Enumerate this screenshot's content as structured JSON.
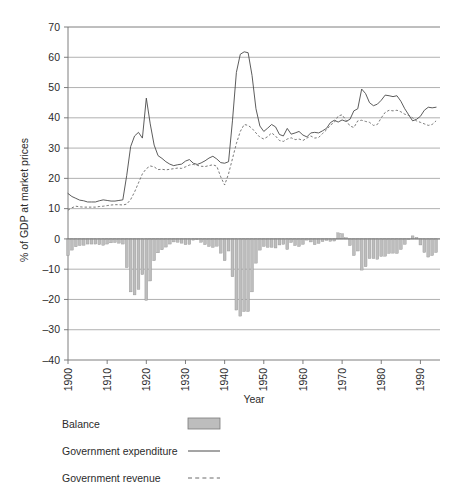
{
  "chart_data": {
    "type": "bar",
    "title": "",
    "subtitle": "",
    "xlabel": "Year",
    "ylabel": "% of GDP at market prices",
    "xlim": [
      1900,
      1995
    ],
    "ylim": [
      -40,
      70
    ],
    "ytick_values": [
      70,
      60,
      50,
      40,
      30,
      20,
      10,
      0,
      -10,
      -20,
      -30,
      -40
    ],
    "ytick_labels": [
      "70",
      "60",
      "50",
      "40",
      "30",
      "20",
      "10",
      "0",
      "–10",
      "–20",
      "–30",
      "–40"
    ],
    "xtick_values": [
      1900,
      1910,
      1920,
      1930,
      1940,
      1950,
      1960,
      1970,
      1980,
      1990
    ],
    "xtick_labels": [
      "1900",
      "1910",
      "1920",
      "1930",
      "1940",
      "1950",
      "1960",
      "1970",
      "1980",
      "1990"
    ],
    "grid": true,
    "grid_axis": "y",
    "legend_position": "below-plot-left",
    "x": [
      1900,
      1901,
      1902,
      1903,
      1904,
      1905,
      1906,
      1907,
      1908,
      1909,
      1910,
      1911,
      1912,
      1913,
      1914,
      1915,
      1916,
      1917,
      1918,
      1919,
      1920,
      1921,
      1922,
      1923,
      1924,
      1925,
      1926,
      1927,
      1928,
      1929,
      1930,
      1931,
      1932,
      1933,
      1934,
      1935,
      1936,
      1937,
      1938,
      1939,
      1940,
      1941,
      1942,
      1943,
      1944,
      1945,
      1946,
      1947,
      1948,
      1949,
      1950,
      1951,
      1952,
      1953,
      1954,
      1955,
      1956,
      1957,
      1958,
      1959,
      1960,
      1961,
      1962,
      1963,
      1964,
      1965,
      1966,
      1967,
      1968,
      1969,
      1970,
      1971,
      1972,
      1973,
      1974,
      1975,
      1976,
      1977,
      1978,
      1979,
      1980,
      1981,
      1982,
      1983,
      1984,
      1985,
      1986,
      1987,
      1988,
      1989,
      1990,
      1991,
      1992,
      1993,
      1994
    ],
    "series": [
      {
        "name": "Government expenditure",
        "style": "solid-line",
        "color": "#4a4a4a",
        "values": [
          15.0,
          14.0,
          13.4,
          12.8,
          12.6,
          12.2,
          12.2,
          12.2,
          12.6,
          12.9,
          12.7,
          12.5,
          12.5,
          12.7,
          12.9,
          21.0,
          30.5,
          34.0,
          35.2,
          33.3,
          46.5,
          38.0,
          31.0,
          27.5,
          26.6,
          25.5,
          24.7,
          24.2,
          24.5,
          24.7,
          25.7,
          26.2,
          25.0,
          24.6,
          25.1,
          25.8,
          26.7,
          27.3,
          26.4,
          25.2,
          25.0,
          25.5,
          39.0,
          55.0,
          61.0,
          61.8,
          61.5,
          54.0,
          43.0,
          37.3,
          35.5,
          36.6,
          37.8,
          37.0,
          34.5,
          34.0,
          36.5,
          34.6,
          35.0,
          35.5,
          34.3,
          33.7,
          35.0,
          35.2,
          35.0,
          35.7,
          36.5,
          38.4,
          39.2,
          38.6,
          39.3,
          38.8,
          39.5,
          42.3,
          43.0,
          49.5,
          48.0,
          45.0,
          44.0,
          44.5,
          45.8,
          47.5,
          47.3,
          47.0,
          47.3,
          45.5,
          43.0,
          41.0,
          39.0,
          39.5,
          40.5,
          42.5,
          43.5,
          43.3,
          43.5
        ]
      },
      {
        "name": "Government revenue",
        "style": "dashed-line",
        "color": "#6a6a6a",
        "values": [
          9.5,
          10.3,
          10.8,
          10.6,
          10.5,
          10.5,
          10.5,
          10.5,
          10.7,
          10.8,
          11.0,
          11.2,
          11.3,
          11.3,
          11.2,
          11.5,
          13.0,
          15.5,
          18.5,
          21.5,
          23.2,
          24.1,
          23.8,
          22.9,
          23.0,
          22.8,
          23.0,
          23.2,
          23.4,
          23.3,
          23.8,
          24.4,
          24.6,
          24.3,
          24.0,
          23.9,
          24.2,
          24.5,
          24.0,
          20.5,
          17.8,
          21.5,
          26.5,
          31.5,
          35.5,
          37.8,
          37.5,
          36.5,
          35.0,
          33.6,
          33.0,
          33.8,
          35.0,
          34.0,
          32.5,
          32.2,
          33.0,
          33.4,
          32.8,
          33.0,
          32.5,
          33.3,
          34.0,
          33.3,
          33.5,
          34.8,
          36.0,
          37.6,
          38.5,
          40.6,
          41.0,
          39.2,
          37.3,
          36.8,
          39.0,
          39.2,
          38.8,
          38.5,
          37.5,
          37.8,
          40.0,
          41.8,
          42.5,
          42.3,
          42.5,
          42.0,
          41.2,
          40.8,
          40.0,
          39.0,
          38.5,
          38.0,
          37.5,
          37.8,
          39.0
        ]
      }
    ],
    "bar_series": {
      "name": "Balance",
      "color": "#bdbdbd",
      "values": [
        -5.5,
        -3.7,
        -2.6,
        -2.2,
        -2.1,
        -1.7,
        -1.7,
        -1.7,
        -1.9,
        -2.1,
        -1.7,
        -1.3,
        -1.2,
        -1.4,
        -1.7,
        -9.5,
        -17.5,
        -18.5,
        -16.7,
        -11.8,
        -20.3,
        -13.9,
        -7.2,
        -4.6,
        -3.6,
        -2.7,
        -1.7,
        -1.0,
        -1.1,
        -1.4,
        -1.9,
        -1.8,
        -0.4,
        -0.3,
        -1.1,
        -1.9,
        -2.5,
        -2.8,
        -2.4,
        -4.7,
        -7.2,
        -4.0,
        -12.5,
        -23.5,
        -25.5,
        -24.0,
        -24.0,
        -17.5,
        -8.0,
        -3.7,
        -2.5,
        -2.8,
        -2.8,
        -3.0,
        -2.0,
        -1.8,
        -3.5,
        -1.2,
        -2.2,
        -2.5,
        -1.8,
        -0.4,
        -1.0,
        -1.9,
        -1.5,
        -0.9,
        -0.5,
        -0.8,
        -0.7,
        2.0,
        1.7,
        0.4,
        -2.2,
        -5.5,
        -4.0,
        -10.3,
        -9.2,
        -6.5,
        -6.5,
        -6.7,
        -5.8,
        -5.7,
        -4.8,
        -4.7,
        -4.8,
        -3.5,
        -1.8,
        -0.2,
        1.0,
        0.5,
        -2.0,
        -4.5,
        -6.0,
        -5.5,
        -4.5
      ]
    },
    "annotations": {
      "wwi_expenditure_peak": 46.5,
      "wwii_expenditure_peak": 61.8,
      "deepest_deficit_wwi": -28.0,
      "deepest_deficit_wwii": -34.0
    }
  },
  "legend": {
    "items": [
      {
        "label": "Balance",
        "marker": "filled-rectangle"
      },
      {
        "label": "Government expenditure",
        "marker": "solid-line"
      },
      {
        "label": "Government revenue",
        "marker": "dashed-line"
      }
    ]
  }
}
